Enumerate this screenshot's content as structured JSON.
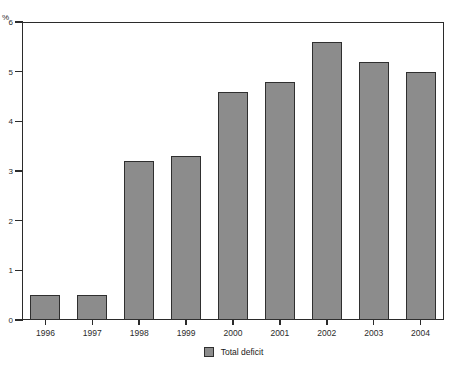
{
  "chart_data": {
    "type": "bar",
    "title": "",
    "subtitle": "",
    "xlabel": "",
    "ylabel": "%",
    "unit_label": "%",
    "categories": [
      "1996",
      "1997",
      "1998",
      "1999",
      "2000",
      "2001",
      "2002",
      "2003",
      "2004"
    ],
    "series": [
      {
        "name": "Total deficit",
        "values": [
          0.5,
          0.5,
          3.2,
          3.3,
          4.6,
          4.8,
          5.6,
          5.2,
          5.0
        ],
        "color": "#8c8c8c"
      }
    ],
    "values": [
      0.5,
      0.5,
      3.2,
      3.3,
      4.6,
      4.8,
      5.6,
      5.2,
      5.0
    ],
    "ylim": [
      0,
      6
    ],
    "yticks": [
      0,
      1,
      2,
      3,
      4,
      5,
      6
    ],
    "ytick_labels": [
      "0",
      "1",
      "2",
      "3",
      "4",
      "5",
      "6"
    ],
    "grid": false,
    "legend": {
      "position": "bottom-center",
      "entries": [
        {
          "label": "Total deficit",
          "color": "#8c8c8c"
        }
      ]
    },
    "colors": {
      "bar_fill": "#8c8c8c",
      "bar_border": "#2f2f2f",
      "axis": "#2b2b2b",
      "background": "#ffffff"
    }
  },
  "legend": {
    "entry_label": "Total deficit"
  },
  "axes": {
    "y_unit": "%"
  }
}
